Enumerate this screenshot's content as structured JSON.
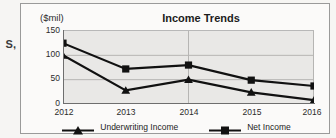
{
  "margin_fragment": "S,",
  "chart": {
    "title": "Income Trends",
    "units_label": "($mil)",
    "frame_color": "#9a9a9a",
    "plot_bg_color": "#e9e8e6",
    "series_color": "#111111"
  },
  "legend": {
    "position": "bottom",
    "entries": [
      {
        "label": "Underwriting Income",
        "marker": "triangle-marker"
      },
      {
        "label": "Net Income",
        "marker": "square-marker"
      }
    ]
  },
  "axes": {
    "y_ticks": [
      "150",
      "100",
      "50",
      "0"
    ],
    "x_ticks": [
      "2012",
      "2013",
      "2014",
      "2015",
      "2016"
    ]
  },
  "chart_data": {
    "type": "line",
    "title": "Income Trends",
    "xlabel": "",
    "ylabel": "($mil)",
    "ylim": [
      0,
      150
    ],
    "yticks": [
      0,
      50,
      100,
      150
    ],
    "grid": true,
    "legend_position": "bottom",
    "categories": [
      "2012",
      "2013",
      "2014",
      "2015",
      "2016"
    ],
    "series": [
      {
        "name": "Underwriting Income",
        "marker": "triangle",
        "values": [
          100,
          28,
          50,
          24,
          8
        ]
      },
      {
        "name": "Net Income",
        "marker": "square",
        "values": [
          125,
          72,
          80,
          49,
          37
        ]
      }
    ]
  }
}
